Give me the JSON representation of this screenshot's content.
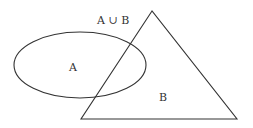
{
  "diagram": {
    "title_label": "A ∪ B",
    "set_a": {
      "label": "A",
      "shape": "ellipse"
    },
    "set_b": {
      "label": "B",
      "shape": "triangle"
    },
    "stroke_color": "#333333",
    "background_color": "#ffffff"
  }
}
